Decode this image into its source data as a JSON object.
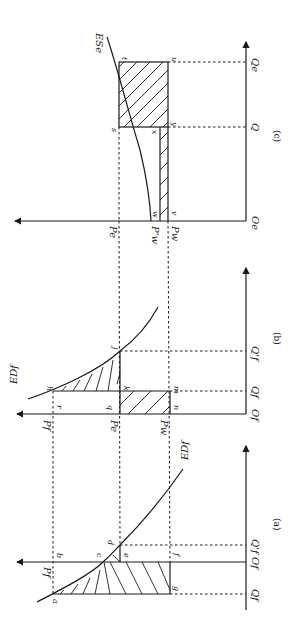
{
  "panels": {
    "c": {
      "caption": "(c)",
      "curve_label": "ESe",
      "origin": "Oe",
      "axis_labels": {
        "Q": "Q",
        "Qe": "Qe",
        "Pe": "Pe",
        "Pw_prime": "P'w",
        "Pw": "Pw"
      },
      "points": {
        "s": "s",
        "t": "t",
        "u": "u",
        "x": "x",
        "y": "y",
        "w": "w",
        "v": "v"
      }
    },
    "b": {
      "caption": "(b)",
      "curve_label": "EDf",
      "origin": "Of",
      "axis_labels": {
        "Qf": "Qf",
        "Qf_prime": "Q'f",
        "Pf": "Pf",
        "Pe": "Pe",
        "Pw": "Pw"
      },
      "points": {
        "h": "h",
        "j": "j",
        "k": "k",
        "m": "m",
        "n": "n",
        "q": "q",
        "r": "r"
      }
    },
    "a": {
      "caption": "(a)",
      "curve_label": "EDf",
      "origin": "Of",
      "axis_labels": {
        "Qf": "Qf",
        "Qf_prime": "Q'f",
        "Pf": "Pf"
      },
      "points": {
        "a": "a",
        "b": "b",
        "c": "c",
        "d": "d",
        "e": "e",
        "f": "f",
        "g": "g"
      }
    }
  }
}
